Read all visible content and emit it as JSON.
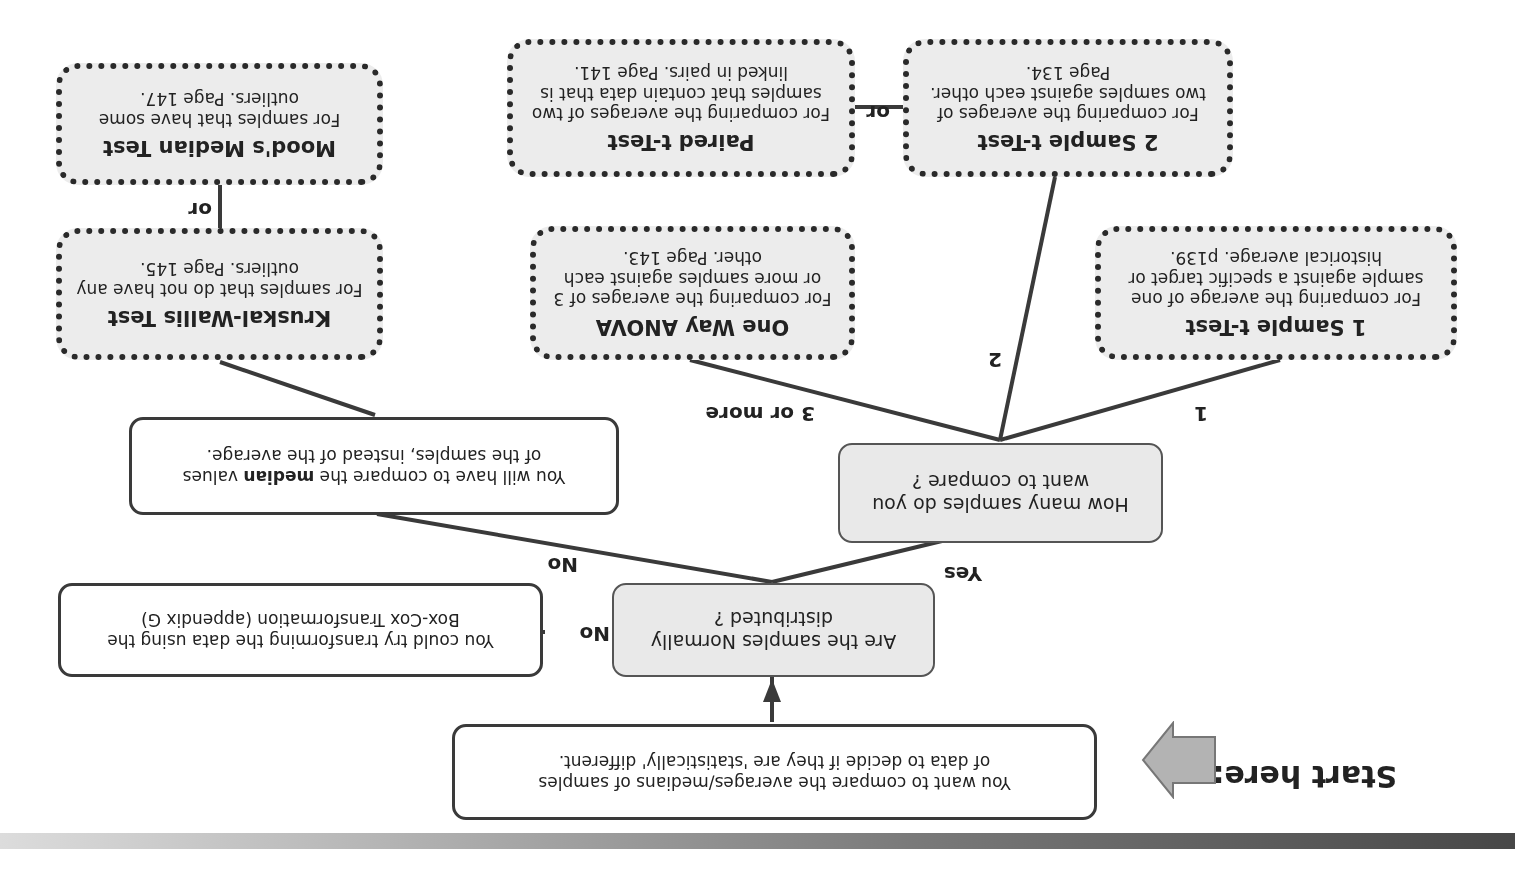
{
  "orientation": "rotated 180 degrees",
  "start": {
    "label": "Start here:",
    "box_text_line1": "You want to compare the averages/medians of samples",
    "box_text_line2": "of data to decide if they are 'statistically' different."
  },
  "normality": {
    "question_line1": "Are the samples Normally",
    "question_line2": "distributed ?",
    "no_label": "No",
    "boxcox_line1": "You could try transforming the data using the",
    "boxcox_line2": "Box-Cox Transformation (appendix G)"
  },
  "branches": {
    "yes_label": "Yes",
    "no_label": "No"
  },
  "how_many": {
    "question_line1": "How many samples do you",
    "question_line2": "want to compare ?",
    "labels": {
      "one": "1",
      "two": "2",
      "three_plus": "3 or more"
    }
  },
  "median_note": {
    "line1_pre": "You will have to compare the ",
    "line1_bold": "median",
    "line1_post": " values",
    "line2": "of the samples, instead of the average."
  },
  "tests": [
    {
      "title": "1 Sample t-Test",
      "desc": "For comparing the average of one sample against a specific target or historical average. p139."
    },
    {
      "title": "2 Sample t-Test",
      "desc": "For comparing the averages of two samples against each other. Page 134."
    },
    {
      "title": "Paired t-Test",
      "desc": "For comparing the averages of two samples that contain data that is linked in pairs. Page 141."
    },
    {
      "title": "One Way ANOVA",
      "desc": "For comparing the averages of 3 or more samples against each other. Page 143."
    },
    {
      "title": "Kruskal-Wallis Test",
      "desc": "For samples that do not have any outliers. Page 145."
    },
    {
      "title": "Mood's Median Test",
      "desc": "For samples that have some outliers. Page 147."
    }
  ],
  "or_labels": {
    "ttests": "or",
    "nonparam": "or"
  },
  "colors": {
    "box_fill_grey": "#e9e9e9",
    "box_fill_white": "#ffffff",
    "line": "#3a3a3a",
    "arrow_fill": "#b3b3b3"
  }
}
